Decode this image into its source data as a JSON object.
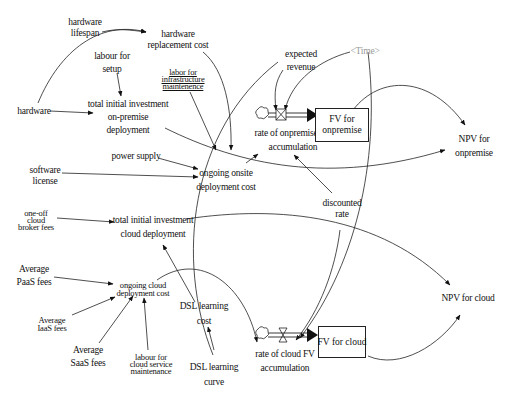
{
  "diagram": {
    "type": "stock-and-flow",
    "variables": {
      "hardware_lifespan": "hardware\nlifespan",
      "hardware_replacement_cost": "hardware\nreplacement cost",
      "labour_for_setup": "labour for\nsetup",
      "labor_for_infrastructure_maintenance": "labor for\ninfrastructure\nmaintenence",
      "hardware": "hardware",
      "total_initial_investment_onpremise": "total initial investment\non-premise\ndeployment",
      "expected_revenue": "expected\nrevenue",
      "time": "<Time>",
      "rate_onpremise": "rate of onpremise FV\naccumulation",
      "fv_onpremise": "FV for\nonpremise",
      "npv_onpremise": "NPV for\nonpremise",
      "power_supply": "power supply",
      "software_license": "software\nlicense",
      "ongoing_onsite_cost": "ongoing onsite\ndeployment cost",
      "discounted_rate": "discounted\nrate",
      "one_off_cloud_broker_fees": "one-off\ncloud\nbroker fees",
      "total_initial_investment_cloud": "total initial investment\ncloud deployment",
      "average_paas_fees": "Average\nPaaS fees",
      "average_iaas_fees": "Average\nIaaS fees",
      "average_saas_fees": "Average\nSaaS fees",
      "ongoing_cloud_cost": "ongoing cloud\ndeployment cost",
      "labour_cloud_service_maintenance": "labour for\ncloud service\nmaintenance",
      "dsl_learning_cost": "DSL learning\ncost",
      "dsl_learning_curve": "DSL learning\ncurve",
      "rate_cloud": "rate of cloud FV\naccumulation",
      "fv_cloud": "FV for cloud",
      "npv_cloud": "NPV for cloud"
    },
    "stocks": [
      "FV for onpremise",
      "FV for cloud"
    ],
    "flows": [
      "rate of onpremise FV accumulation",
      "rate of cloud FV accumulation"
    ],
    "links": [
      [
        "hardware lifespan",
        "hardware replacement cost"
      ],
      [
        "hardware",
        "hardware replacement cost"
      ],
      [
        "hardware",
        "total initial investment on-premise deployment"
      ],
      [
        "labour for setup",
        "total initial investment on-premise deployment"
      ],
      [
        "hardware replacement cost",
        "ongoing onsite deployment cost"
      ],
      [
        "labor for infrastructure maintenence",
        "ongoing onsite deployment cost"
      ],
      [
        "power supply",
        "ongoing onsite deployment cost"
      ],
      [
        "software license",
        "ongoing onsite deployment cost"
      ],
      [
        "ongoing onsite deployment cost",
        "rate of onpremise FV accumulation"
      ],
      [
        "expected revenue",
        "rate of onpremise FV accumulation"
      ],
      [
        "<Time>",
        "rate of onpremise FV accumulation"
      ],
      [
        "discounted rate",
        "rate of onpremise FV accumulation"
      ],
      [
        "total initial investment on-premise deployment",
        "NPV for onpremise"
      ],
      [
        "FV for onpremise",
        "NPV for onpremise"
      ],
      [
        "one-off cloud broker fees",
        "total initial investment cloud deployment"
      ],
      [
        "DSL learning cost",
        "total initial investment cloud deployment"
      ],
      [
        "total initial investment cloud deployment",
        "NPV for cloud"
      ],
      [
        "FV for cloud",
        "NPV for cloud"
      ],
      [
        "Average PaaS fees",
        "ongoing cloud deployment cost"
      ],
      [
        "Average IaaS fees",
        "ongoing cloud deployment cost"
      ],
      [
        "Average SaaS fees",
        "ongoing cloud deployment cost"
      ],
      [
        "labour for cloud service maintenance",
        "ongoing cloud deployment cost"
      ],
      [
        "ongoing cloud deployment cost",
        "rate of cloud FV accumulation"
      ],
      [
        "DSL learning curve",
        "DSL learning cost"
      ],
      [
        "expected revenue",
        "rate of cloud FV accumulation"
      ],
      [
        "<Time>",
        "rate of cloud FV accumulation"
      ],
      [
        "discounted rate",
        "rate of cloud FV accumulation"
      ]
    ]
  }
}
